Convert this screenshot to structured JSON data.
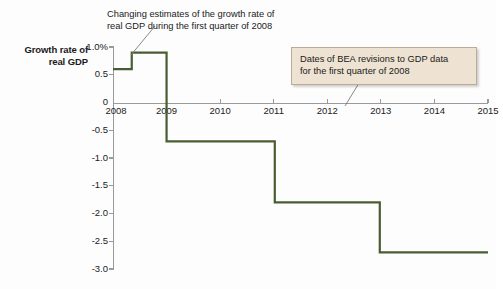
{
  "axis_title": "Growth rate\nof real GDP",
  "annotations": {
    "growth_note": "Changing estimates of the growth rate of\nreal GDP during the first quarter of 2008",
    "bea_note": "Dates of BEA revisions to GDP data\nfor the first quarter of 2008"
  },
  "colors": {
    "series": "#4a5d32",
    "axis": "#9a9a9a",
    "callout_bg": "#eee3d2",
    "callout_border": "#b9ab94",
    "text": "#1a1a1a",
    "background": "#fdfdfd"
  },
  "chart_data": {
    "type": "line",
    "title": "",
    "subtitle": "",
    "xlabel": "",
    "ylabel": "Growth rate of real GDP",
    "xlim": [
      2008,
      2015
    ],
    "ylim": [
      -3.0,
      1.0
    ],
    "grid": false,
    "legend": "none",
    "step_style": "post",
    "x_ticks": [
      2008,
      2009,
      2010,
      2011,
      2012,
      2013,
      2014,
      2015
    ],
    "x_tick_labels": [
      "2008",
      "2009",
      "2010",
      "2011",
      "2012",
      "2013",
      "2014",
      "2015"
    ],
    "y_ticks": [
      1.0,
      0.5,
      0,
      -0.5,
      -1.0,
      -1.5,
      -2.0,
      -2.5,
      -3.0
    ],
    "y_tick_labels": [
      "1.0%",
      "0.5",
      "0",
      "-0.5",
      "-1.0",
      "-1.5",
      "-2.0",
      "-2.5",
      "-3.0"
    ],
    "series": [
      {
        "name": "Estimated growth rate of real GDP, 2008Q1",
        "color": "#4a5d32",
        "points": [
          {
            "x": 2008.0,
            "y": 0.6
          },
          {
            "x": 2008.35,
            "y": 0.9
          },
          {
            "x": 2009.0,
            "y": -0.7
          },
          {
            "x": 2011.02,
            "y": -1.8
          },
          {
            "x": 2012.98,
            "y": -2.7
          },
          {
            "x": 2015.0,
            "y": -2.7
          }
        ]
      }
    ],
    "revision_values": [
      0.6,
      0.9,
      -0.7,
      -1.8,
      -2.7
    ],
    "revision_dates": [
      2008.0,
      2008.35,
      2009.0,
      2011.02,
      2012.98
    ]
  }
}
